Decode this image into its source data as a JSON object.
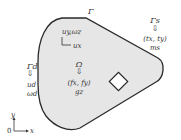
{
  "diagram": {
    "type": "continuum-mechanics-domain",
    "domain_label": "Ω",
    "boundary_label": "Γ",
    "dirichlet": {
      "label": "Γd",
      "values": [
        "ud",
        "ωd"
      ]
    },
    "neumann": {
      "label": "Γs",
      "traction": "(tx, ty)",
      "moment": "ms"
    },
    "body_force": {
      "force": "(fx, fy)",
      "couple": "gz"
    },
    "local_dofs": {
      "vertical": "uy,ωz",
      "horizontal": "ux"
    },
    "axes": {
      "origin": "0",
      "x": "x",
      "y": "y"
    },
    "colors": {
      "domain_fill": "#e6e6e6",
      "outline": "#2a2a2a",
      "hole_fill": "#ffffff"
    }
  }
}
